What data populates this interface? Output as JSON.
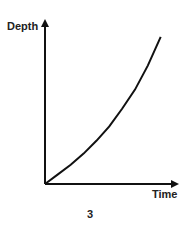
{
  "chart_data": {
    "type": "line",
    "title": "",
    "xlabel": "Time",
    "ylabel": "Depth",
    "caption": "3",
    "grid": false,
    "legend": null,
    "x_ticks": [],
    "y_ticks": [],
    "xlim": [
      0,
      1
    ],
    "ylim": [
      0,
      1
    ],
    "series": [
      {
        "name": "depth-vs-time",
        "shape": "convex increasing (accelerating)",
        "x": [
          0,
          0.1,
          0.2,
          0.3,
          0.4,
          0.5,
          0.6,
          0.7,
          0.8,
          0.9,
          0.9
        ],
        "y": [
          0,
          0.06,
          0.12,
          0.19,
          0.27,
          0.36,
          0.47,
          0.59,
          0.74,
          0.92,
          0.92
        ]
      }
    ]
  },
  "colors": {
    "axis": "#111111",
    "curve": "#111111",
    "text": "#222222",
    "background": "#ffffff"
  }
}
